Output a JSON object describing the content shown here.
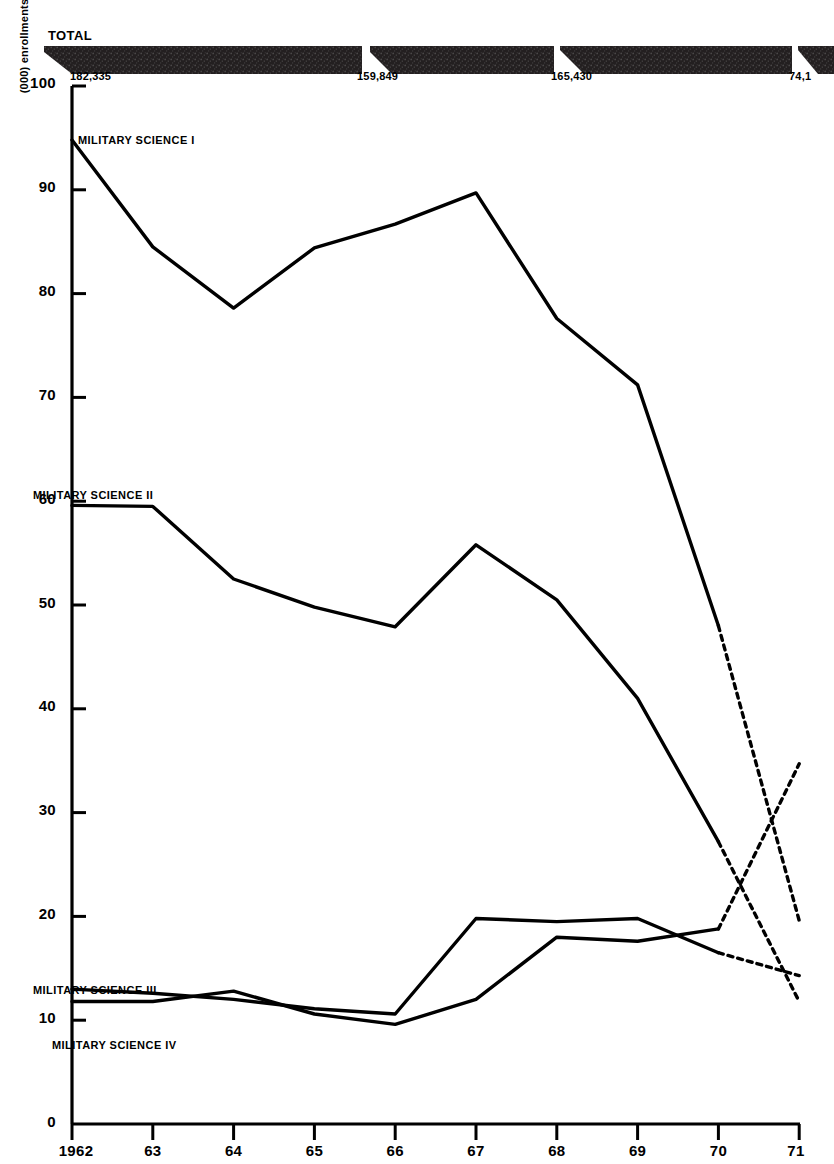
{
  "figure": {
    "y_axis_caption": "(000) enrollments",
    "total_caption": "TOTAL"
  },
  "chart_data": {
    "type": "line",
    "title": "",
    "subtitle": "",
    "xlabel": "",
    "ylabel": "(000) enrollments",
    "grid": false,
    "legend_position": "inline-series-labels",
    "x": [
      1962,
      1963,
      1964,
      1965,
      1966,
      1967,
      1968,
      1969,
      1970,
      1971
    ],
    "categories": [
      "1962",
      "63",
      "64",
      "65",
      "66",
      "67",
      "68",
      "69",
      "70",
      "71"
    ],
    "xlim": [
      1962,
      1971
    ],
    "ylim": [
      0,
      100
    ],
    "ytick_labels": [
      "0",
      "10",
      "20",
      "30",
      "40",
      "50",
      "60",
      "70",
      "80",
      "90",
      "100"
    ],
    "ytick_values": [
      0,
      10,
      20,
      30,
      40,
      50,
      60,
      70,
      80,
      90,
      100
    ],
    "projected_from": 1970,
    "projected_note": "Segments from 1970 to 1971 are drawn dashed (projected).",
    "series": [
      {
        "name": "MILITARY SCIENCE I",
        "label": "MILITARY SCIENCE I",
        "values": [
          94.8,
          84.5,
          78.6,
          84.4,
          86.7,
          89.7,
          77.6,
          71.2,
          48.0,
          19.6
        ],
        "dashed_segment": [
          1970,
          1971
        ]
      },
      {
        "name": "MILITARY SCIENCE II",
        "label": "MILITARY SCIENCE II",
        "values": [
          59.6,
          59.5,
          52.5,
          49.8,
          47.9,
          55.8,
          50.5,
          41.0,
          27.2,
          11.8
        ],
        "dashed_segment": [
          1970,
          1971
        ]
      },
      {
        "name": "MILITARY SCIENCE III",
        "label": "MILITARY SCIENCE III",
        "values": [
          13.0,
          12.6,
          12.0,
          11.1,
          10.6,
          19.8,
          19.5,
          19.8,
          16.5,
          14.3
        ],
        "dashed_segment": [
          1970,
          1971
        ]
      },
      {
        "name": "MILITARY SCIENCE IV",
        "label": "MILITARY SCIENCE IV",
        "values": [
          11.8,
          11.8,
          12.8,
          10.6,
          9.6,
          12.0,
          18.0,
          17.6,
          18.8,
          34.7
        ],
        "dashed_segment": [
          1970,
          1971
        ]
      }
    ],
    "total_band": {
      "caption": "TOTAL",
      "series_name": "TOTAL",
      "segments": [
        {
          "label": "182,335",
          "x": 78
        },
        {
          "label": "159,849",
          "x": 362
        },
        {
          "label": "165,430",
          "x": 555
        },
        {
          "label": "74,1",
          "x": 793,
          "truncated": true
        }
      ]
    }
  },
  "axis": {
    "y_ticks": [
      {
        "label": "100",
        "value": 100
      },
      {
        "label": "90",
        "value": 90
      },
      {
        "label": "80",
        "value": 80
      },
      {
        "label": "70",
        "value": 70
      },
      {
        "label": "60",
        "value": 60
      },
      {
        "label": "50",
        "value": 50
      },
      {
        "label": "40",
        "value": 40
      },
      {
        "label": "30",
        "value": 30
      },
      {
        "label": "20",
        "value": 20
      },
      {
        "label": "10",
        "value": 10
      },
      {
        "label": "0",
        "value": 0
      }
    ],
    "x_ticks": [
      {
        "label": "1962",
        "value": 1962
      },
      {
        "label": "63",
        "value": 1963
      },
      {
        "label": "64",
        "value": 1964
      },
      {
        "label": "65",
        "value": 1965
      },
      {
        "label": "66",
        "value": 1966
      },
      {
        "label": "67",
        "value": 1967
      },
      {
        "label": "68",
        "value": 1968
      },
      {
        "label": "69",
        "value": 1969
      },
      {
        "label": "70",
        "value": 1970
      },
      {
        "label": "71",
        "value": 1971
      }
    ]
  },
  "series_labels": [
    {
      "text": "MILITARY SCIENCE I",
      "x": 78,
      "y": 134
    },
    {
      "text": "MILITARY SCIENCE II",
      "x": 33,
      "y": 489
    },
    {
      "text": "MILITARY SCIENCE III",
      "x": 33,
      "y": 984
    },
    {
      "text": "MILITARY SCIENCE IV",
      "x": 52,
      "y": 1039
    }
  ],
  "colors": {
    "ink": "#000000",
    "paper": "#ffffff",
    "band": "#231f20"
  }
}
